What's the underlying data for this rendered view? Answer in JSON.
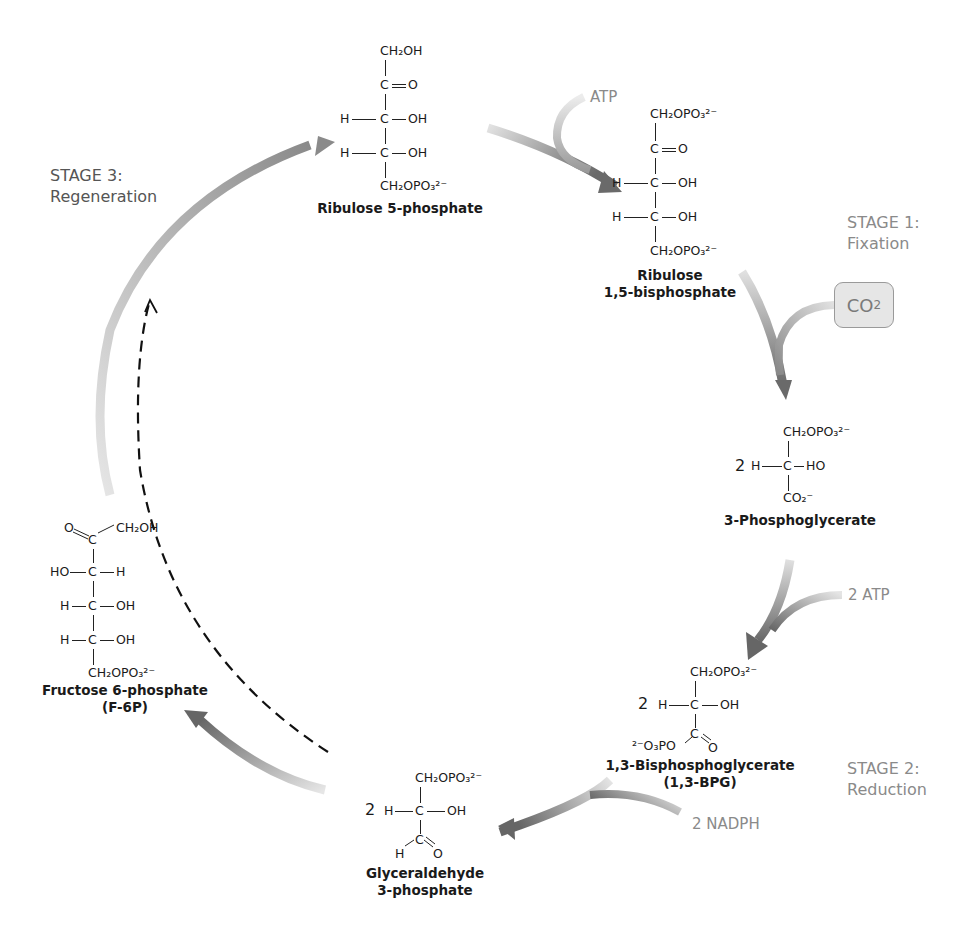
{
  "stages": [
    {
      "id": "stage1",
      "title": "STAGE 1:",
      "subtitle": "Fixation"
    },
    {
      "id": "stage2",
      "title": "STAGE 2:",
      "subtitle": "Reduction"
    },
    {
      "id": "stage3",
      "title": "STAGE 3:",
      "subtitle": "Regeneration"
    }
  ],
  "reagents": {
    "atp": "ATP",
    "co2": "CO",
    "co2_sub": "2",
    "two_atp": "2 ATP",
    "two_nadph": "2 NADPH"
  },
  "molecules": {
    "ribulose5p": {
      "name": "Ribulose 5-phosphate",
      "top": "CH₂OH",
      "c2": "C",
      "c2_right": "O",
      "h3": "H",
      "c3": "C",
      "oh3": "OH",
      "h4": "H",
      "c4": "C",
      "oh4": "OH",
      "bottom": "CH₂OPO₃²⁻"
    },
    "rubp": {
      "name_line1": "Ribulose",
      "name_line2": "1,5-bisphosphate",
      "top": "CH₂OPO₃²⁻",
      "c2": "C",
      "c2_right": "O",
      "h3": "H",
      "c3": "C",
      "oh3": "OH",
      "h4": "H",
      "c4": "C",
      "oh4": "OH",
      "bottom": "CH₂OPO₃²⁻"
    },
    "pga3": {
      "name": "3-Phosphoglycerate",
      "coef": "2",
      "top": "CH₂OPO₃²⁻",
      "h": "H",
      "c": "C",
      "right": "HO",
      "bottom": "CO₂⁻"
    },
    "bpg13": {
      "name_line1": "1,3-Bisphosphoglycerate",
      "name_line2": "(1,3-BPG)",
      "coef": "2",
      "top": "CH₂OPO₃²⁻",
      "h": "H",
      "c": "C",
      "right": "OH",
      "c1": "C",
      "left": "²⁻O₃PO",
      "o": "O"
    },
    "g3p": {
      "name_line1": "Glyceraldehyde",
      "name_line2": "3-phosphate",
      "coef": "2",
      "top": "CH₂OPO₃²⁻",
      "h": "H",
      "c": "C",
      "right": "OH",
      "c1": "C",
      "ald_h": "H",
      "o": "O"
    },
    "f6p": {
      "name_line1": "Fructose 6-phosphate",
      "name_line2": "(F-6P)",
      "o": "O",
      "c2": "C",
      "top_right": "CH₂OH",
      "ho3": "HO",
      "c3": "C",
      "h3": "H",
      "h4": "H",
      "c4": "C",
      "oh4": "OH",
      "h5": "H",
      "c5": "C",
      "oh5": "OH",
      "bottom": "CH₂OPO₃²⁻"
    }
  },
  "colors": {
    "arrow_dark": "#6e6e6e",
    "arrow_light": "#d4d4d4",
    "stage_text": "#8a8a8a",
    "co2_box_fill": "#e6e6e6"
  }
}
